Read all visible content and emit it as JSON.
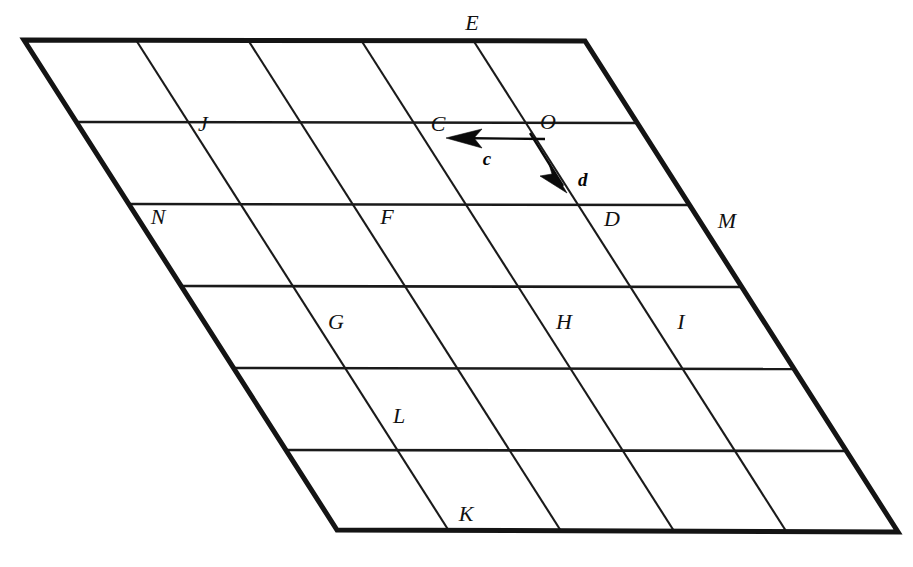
{
  "figure": {
    "kind": "geometry-diagram",
    "background_color": "#ffffff",
    "ink_color": "#141414",
    "outline": {
      "name": "large-parallelogram",
      "corners": [
        {
          "name": "top-left",
          "x": 24,
          "y": 40
        },
        {
          "name": "top-right",
          "x": 585,
          "y": 41
        },
        {
          "name": "bottom-right",
          "x": 898,
          "y": 532
        },
        {
          "name": "bottom-left",
          "x": 337,
          "y": 530
        }
      ],
      "stroke_width": 5
    },
    "grid": {
      "rows": 6,
      "columns": 5,
      "horizontal_line_count": 5,
      "diagonal_line_count": 4,
      "horizontal_stroke_width": 2.6,
      "diagonal_stroke_width": 2.1
    },
    "point_labels": [
      {
        "label": "E",
        "x": 472,
        "y": 30,
        "name": "point-label-E"
      },
      {
        "label": "J",
        "x": 203,
        "y": 131,
        "name": "point-label-J"
      },
      {
        "label": "C",
        "x": 438,
        "y": 131,
        "name": "point-label-C"
      },
      {
        "label": "O",
        "x": 545,
        "y": 129,
        "name": "point-label-O"
      },
      {
        "label": "N",
        "x": 154,
        "y": 224,
        "name": "point-label-N"
      },
      {
        "label": "F",
        "x": 382,
        "y": 224,
        "name": "point-label-F"
      },
      {
        "label": "D",
        "x": 607,
        "y": 226,
        "name": "point-label-D"
      },
      {
        "label": "M",
        "x": 722,
        "y": 228,
        "name": "point-label-M"
      },
      {
        "label": "G",
        "x": 331,
        "y": 329,
        "name": "point-label-G"
      },
      {
        "label": "H",
        "x": 559,
        "y": 329,
        "name": "point-label-H"
      },
      {
        "label": "I",
        "x": 678,
        "y": 329,
        "name": "point-label-I"
      },
      {
        "label": "L",
        "x": 396,
        "y": 423,
        "name": "point-label-L"
      },
      {
        "label": "K",
        "x": 461,
        "y": 521,
        "name": "point-label-K"
      }
    ],
    "vectors": [
      {
        "label": "c",
        "name": "vector-c",
        "direction": "left",
        "tail": {
          "x": 540,
          "y": 139
        },
        "tip": {
          "x": 449,
          "y": 138
        },
        "label_pos": {
          "x": 487,
          "y": 165
        }
      },
      {
        "label": "d",
        "name": "vector-d",
        "direction": "down-right",
        "tail": {
          "x": 534,
          "y": 140
        },
        "tip": {
          "x": 566,
          "y": 191
        },
        "label_pos": {
          "x": 578,
          "y": 186
        }
      }
    ]
  }
}
